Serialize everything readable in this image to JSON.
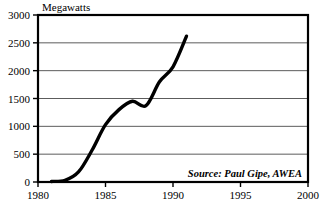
{
  "chart_data": {
    "type": "line",
    "title": "",
    "ylabel": "Megawatts",
    "xlabel": "",
    "xlim": [
      1980,
      2000
    ],
    "ylim": [
      0,
      3000
    ],
    "grid": true,
    "legend": "none",
    "annotation": "Source: Paul Gipe, AWEA",
    "x_ticks": [
      "1980",
      "1985",
      "1990",
      "1995",
      "2000"
    ],
    "x_tick_values": [
      1980,
      1985,
      1990,
      1995,
      2000
    ],
    "y_ticks": [
      "0",
      "500",
      "1000",
      "1500",
      "2000",
      "2500",
      "3000"
    ],
    "y_tick_values": [
      0,
      500,
      1000,
      1500,
      2000,
      2500,
      3000
    ],
    "series": [
      {
        "name": "Installed wind capacity",
        "x": [
          1981,
          1982,
          1983,
          1984,
          1985,
          1986,
          1987,
          1988,
          1989,
          1990,
          1991
        ],
        "values": [
          10,
          30,
          180,
          570,
          1030,
          1300,
          1450,
          1370,
          1800,
          2070,
          2620
        ]
      }
    ]
  },
  "labels": {
    "y_axis_title": "Megawatts",
    "source": "Source: Paul Gipe, AWEA"
  }
}
